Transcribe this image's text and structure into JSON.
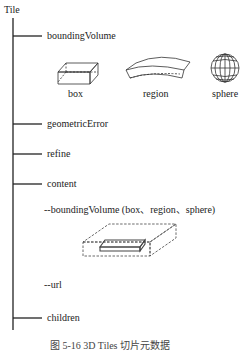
{
  "root": {
    "label": "Tile"
  },
  "branches": [
    {
      "label": "boundingVolume"
    },
    {
      "label": "geometricError"
    },
    {
      "label": "refine"
    },
    {
      "label": "content"
    },
    {
      "label": "children"
    }
  ],
  "bounding_volume_types": [
    {
      "label": "box",
      "icon": "box-icon"
    },
    {
      "label": "region",
      "icon": "region-icon"
    },
    {
      "label": "sphere",
      "icon": "sphere-icon"
    }
  ],
  "content_items": [
    {
      "label": "--boundingVolume (box、region、sphere)"
    },
    {
      "label": "--url"
    }
  ],
  "caption": "图 5-16  3D Tiles 切片元数据"
}
